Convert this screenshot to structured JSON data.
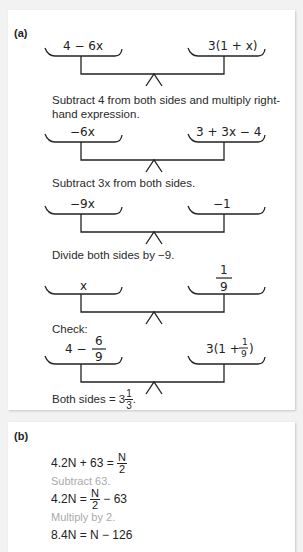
{
  "part_a": {
    "label": "(a)",
    "scales": [
      {
        "left": "4 − 6x",
        "right": "3(1 + x)"
      },
      {
        "left": "−6x",
        "right": "3 + 3x − 4"
      },
      {
        "left": "−9x",
        "right": "−1"
      },
      {
        "left": "x",
        "right_num": "1",
        "right_den": "9"
      },
      {
        "left_whole": "4 −",
        "left_num": "6",
        "left_den": "9",
        "right_pre": "3(1 +",
        "right_num": "1",
        "right_den": "9",
        "right_post": ")"
      }
    ],
    "captions": [
      "Subtract 4 from both sides and multiply right-hand expression.",
      "Subtract 3x from both sides.",
      "Divide both sides by −9.",
      "Check:"
    ],
    "conclusion": {
      "text": "Both sides = 3",
      "num": "1",
      "den": "3",
      "end": "."
    }
  },
  "part_b": {
    "label": "(b)",
    "lines": [
      {
        "type": "eq",
        "lhs": "4.2N + 63 = ",
        "num": "N",
        "den": "2",
        "tail": ""
      },
      {
        "type": "step",
        "text": "Subtract 63."
      },
      {
        "type": "eq",
        "lhs": "4.2N = ",
        "num": "N",
        "den": "2",
        "tail": " − 63"
      },
      {
        "type": "step",
        "text": "Multiply by 2."
      },
      {
        "type": "eq",
        "text": "8.4N = N − 126"
      }
    ]
  }
}
